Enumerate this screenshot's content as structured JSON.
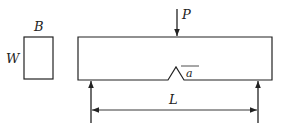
{
  "diagram": {
    "cross_section": {
      "width_label": "B",
      "height_label": "W"
    },
    "beam": {
      "load_label": "P",
      "notch_label": "a",
      "span_label": "L"
    },
    "colors": {
      "stroke": "#222222",
      "background": "#ffffff"
    }
  }
}
